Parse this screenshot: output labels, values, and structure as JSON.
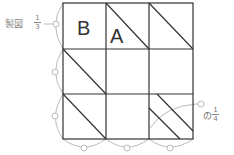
{
  "title": "製図",
  "fraction_left": {
    "numerator": "1",
    "denominator": "3"
  },
  "fraction_right": {
    "prefix": "の",
    "numerator": "1",
    "denominator": "4"
  },
  "cells": {
    "b_label": "B",
    "a_label": "A"
  },
  "grid": {
    "rows": 3,
    "cols": 3
  },
  "colors": {
    "line": "#333333",
    "guide": "#bbbbbb",
    "text": "#666666"
  }
}
